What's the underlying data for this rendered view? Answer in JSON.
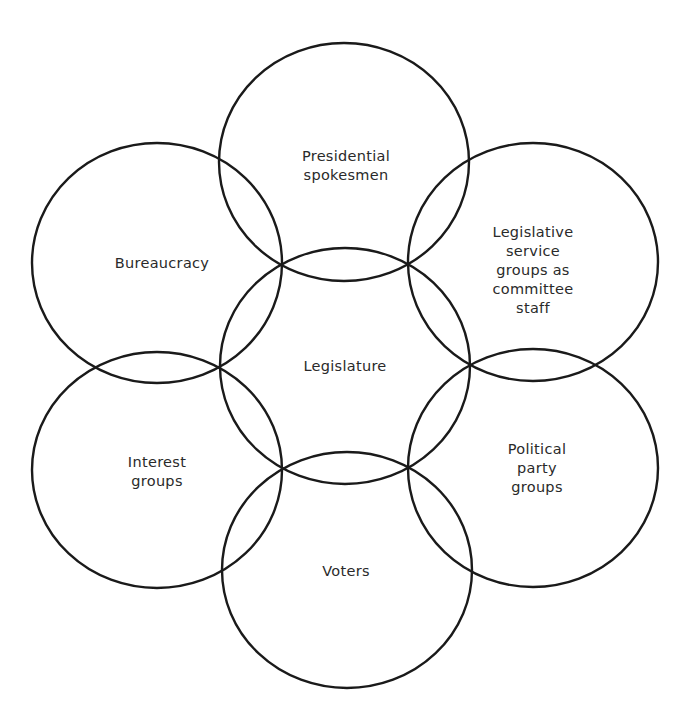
{
  "diagram": {
    "type": "overlapping-circles",
    "stroke_color": "#1a1a1a",
    "text_color": "#2a2a2a",
    "background": "#ffffff",
    "center_node": {
      "id": "legislature",
      "lines": [
        "Legislature"
      ],
      "cx": 345,
      "cy": 366,
      "rx": 125,
      "ry": 118
    },
    "nodes": [
      {
        "id": "presidential-spokesmen",
        "lines": [
          "Presidential",
          "spokesmen"
        ],
        "cx": 344,
        "cy": 162,
        "rx": 125,
        "ry": 119,
        "label_x": 346,
        "label_y": 166
      },
      {
        "id": "legislative-service-groups",
        "lines": [
          "Legislative",
          "service",
          "groups as",
          "committee",
          "staff"
        ],
        "cx": 533,
        "cy": 262,
        "rx": 125,
        "ry": 119,
        "label_x": 533,
        "label_y": 270
      },
      {
        "id": "political-party-groups",
        "lines": [
          "Political",
          "party",
          "groups"
        ],
        "cx": 533,
        "cy": 468,
        "rx": 125,
        "ry": 119,
        "label_x": 537,
        "label_y": 468
      },
      {
        "id": "voters",
        "lines": [
          "Voters"
        ],
        "cx": 347,
        "cy": 570,
        "rx": 125,
        "ry": 118,
        "label_x": 346,
        "label_y": 571
      },
      {
        "id": "interest-groups",
        "lines": [
          "Interest",
          "groups"
        ],
        "cx": 157,
        "cy": 470,
        "rx": 125,
        "ry": 118,
        "label_x": 157,
        "label_y": 472
      },
      {
        "id": "bureaucracy",
        "lines": [
          "Bureaucracy"
        ],
        "cx": 157,
        "cy": 263,
        "rx": 125,
        "ry": 120,
        "label_x": 162,
        "label_y": 263
      }
    ]
  }
}
